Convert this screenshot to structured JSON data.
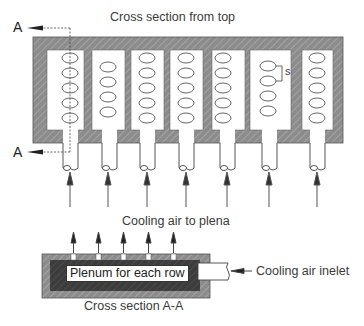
{
  "diagram": {
    "top_title": "Cross section from top",
    "middle_label": "Cooling air to plena",
    "bottom_title": "Cross section A-A",
    "section_marker_top": "A",
    "section_marker_bottom": "A",
    "spacing_label": "s",
    "plenum_label": "Plenum for each row",
    "inlet_label": "Cooling air inelet",
    "rows": [
      {
        "index": 1,
        "tubes": 5
      },
      {
        "index": 2,
        "tubes": 4
      },
      {
        "index": 3,
        "tubes": 5
      },
      {
        "index": 4,
        "tubes": 5
      },
      {
        "index": 5,
        "tubes": 5
      },
      {
        "index": 6,
        "tubes": 4
      },
      {
        "index": 7,
        "tubes": 5
      }
    ],
    "plenum_outlets": 5,
    "colors": {
      "hatch_fill": "#8a8a8a",
      "plenum_dark": "#3a3a3a",
      "line": "#333333"
    }
  }
}
